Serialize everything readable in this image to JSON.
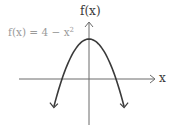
{
  "chart_data": {
    "type": "line",
    "title": "",
    "xlabel": "x",
    "ylabel": "f(x)",
    "annotations": [
      {
        "text": "f(x) = 4 − x²",
        "position": "upper-left"
      }
    ],
    "series": [
      {
        "name": "f(x) = 4 − x²",
        "x": [
          -2.6,
          -2.4,
          -2.2,
          -2,
          -1.5,
          -1,
          -0.5,
          0,
          0.5,
          1,
          1.5,
          2,
          2.2,
          2.4,
          2.6
        ],
        "values": [
          -2.76,
          -1.76,
          -0.84,
          0,
          1.75,
          3,
          3.75,
          4,
          3.75,
          3,
          1.75,
          0,
          -0.84,
          -1.76,
          -2.76
        ]
      }
    ],
    "vertex": {
      "x": 0,
      "y": 4
    },
    "x_intercepts": [
      -2,
      2
    ],
    "grid": false,
    "tick_labels": false,
    "axes_arrows": true
  },
  "labels": {
    "y_axis": "f(x)",
    "x_axis": "x",
    "equation_prefix": "f(x) = 4 − x",
    "equation_exponent": "2"
  },
  "colors": {
    "curve": "#3a3a3a",
    "axes": "#6a6a6a",
    "equation_text": "#9a9a9a"
  }
}
